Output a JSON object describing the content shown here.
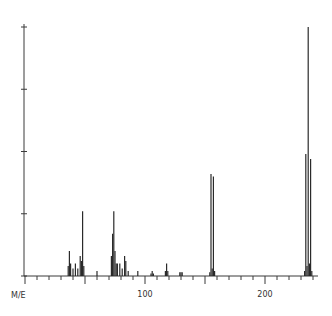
{
  "chart_data": {
    "type": "bar",
    "title": "",
    "xlabel": "M/E",
    "ylabel": "",
    "xlim": [
      0,
      240
    ],
    "ylim": [
      0,
      100
    ],
    "x_ticks_labeled": [
      100,
      200
    ],
    "x_minor_tick_step": 10,
    "x_major_tick_step": 50,
    "y_ticks": [
      0,
      25,
      50,
      75,
      100
    ],
    "y_tick_labels_shown": false,
    "grid": false,
    "legend": null,
    "peaks": [
      {
        "mz": 36,
        "intensity": 4
      },
      {
        "mz": 37,
        "intensity": 10
      },
      {
        "mz": 38,
        "intensity": 5
      },
      {
        "mz": 40,
        "intensity": 3
      },
      {
        "mz": 42,
        "intensity": 5
      },
      {
        "mz": 44,
        "intensity": 3
      },
      {
        "mz": 46,
        "intensity": 8
      },
      {
        "mz": 47,
        "intensity": 6
      },
      {
        "mz": 48,
        "intensity": 26
      },
      {
        "mz": 49,
        "intensity": 4
      },
      {
        "mz": 60,
        "intensity": 2
      },
      {
        "mz": 72,
        "intensity": 8
      },
      {
        "mz": 73,
        "intensity": 17
      },
      {
        "mz": 74,
        "intensity": 26
      },
      {
        "mz": 75,
        "intensity": 10
      },
      {
        "mz": 76,
        "intensity": 5
      },
      {
        "mz": 77,
        "intensity": 5
      },
      {
        "mz": 79,
        "intensity": 5
      },
      {
        "mz": 81,
        "intensity": 3
      },
      {
        "mz": 83,
        "intensity": 8
      },
      {
        "mz": 84,
        "intensity": 6
      },
      {
        "mz": 86,
        "intensity": 2
      },
      {
        "mz": 94,
        "intensity": 2
      },
      {
        "mz": 105,
        "intensity": 1
      },
      {
        "mz": 106,
        "intensity": 2
      },
      {
        "mz": 107,
        "intensity": 1
      },
      {
        "mz": 117,
        "intensity": 2
      },
      {
        "mz": 118,
        "intensity": 5
      },
      {
        "mz": 119,
        "intensity": 2
      },
      {
        "mz": 129,
        "intensity": 1.5
      },
      {
        "mz": 130,
        "intensity": 1.5
      },
      {
        "mz": 131,
        "intensity": 1.5
      },
      {
        "mz": 154,
        "intensity": 1.5
      },
      {
        "mz": 155,
        "intensity": 41
      },
      {
        "mz": 156,
        "intensity": 3
      },
      {
        "mz": 157,
        "intensity": 40
      },
      {
        "mz": 158,
        "intensity": 2
      },
      {
        "mz": 233,
        "intensity": 2
      },
      {
        "mz": 234,
        "intensity": 49
      },
      {
        "mz": 235,
        "intensity": 4
      },
      {
        "mz": 236,
        "intensity": 100
      },
      {
        "mz": 237,
        "intensity": 5
      },
      {
        "mz": 238,
        "intensity": 47
      },
      {
        "mz": 239,
        "intensity": 2
      }
    ]
  },
  "axis": {
    "x_label": "M/E",
    "tick_100": "100",
    "tick_200": "200"
  }
}
